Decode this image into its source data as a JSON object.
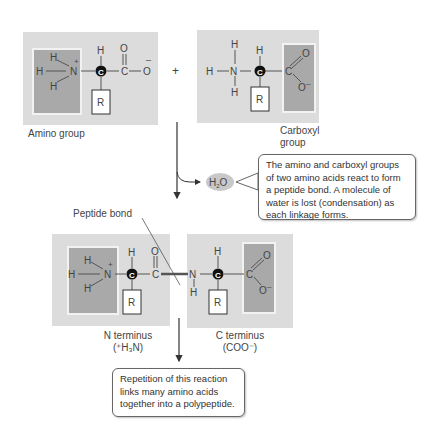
{
  "top_left_molecule": {
    "name": "amino-acid-1",
    "atoms": {
      "h_top": "H",
      "h_left": "H",
      "h_bottom": "H",
      "n": "N",
      "charge_n": "+",
      "c_alpha": "C",
      "h_alpha": "H",
      "c_carbonyl": "C",
      "o_double": "O",
      "o_single": "O",
      "charge_o": "–",
      "r": "R"
    },
    "highlight": "amino group",
    "label": "Amino group"
  },
  "plus_sign": "+",
  "top_right_molecule": {
    "name": "amino-acid-2",
    "atoms": {
      "h_top": "H",
      "h_left": "H",
      "h_bottom": "H",
      "n": "N",
      "c_alpha": "C",
      "h_alpha": "H",
      "c_carbonyl": "C",
      "o_double": "O",
      "o_single": "O",
      "charge_o": "–",
      "r": "R"
    },
    "highlight": "carboxyl group",
    "label_line1": "Carboxyl",
    "label_line2": "group"
  },
  "water": {
    "label": "H",
    "sub": "2",
    "tail": "O"
  },
  "callout_reaction": "The amino and carboxyl groups of two amino acids react to form a peptide bond. A molecule of water is lost (condensation) as each linkage forms.",
  "peptide_bond_label": "Peptide bond",
  "dipeptide": {
    "left": {
      "h_top": "H",
      "h_left": "H",
      "h_bottom": "H",
      "n": "N",
      "charge_n": "+",
      "c_alpha": "C",
      "h_alpha": "H",
      "c_carbonyl": "C",
      "o_double": "O",
      "r": "R"
    },
    "right": {
      "n": "N",
      "h_n": "H",
      "c_alpha": "C",
      "h_alpha": "H",
      "c_carbonyl": "C",
      "o_double": "O",
      "o_single": "O",
      "charge_o": "–",
      "r": "R"
    }
  },
  "n_terminus": {
    "line1": "N terminus",
    "line2": "(⁺H₃N)"
  },
  "c_terminus": {
    "line1": "C terminus",
    "line2": "(COO⁻)"
  },
  "callout_repetition": "Repetition of this reaction links many amino acids together into a polypeptide.",
  "colors": {
    "panel": "#dcdcdc",
    "highlight": "#a9a9a9",
    "water_bubble": "#c8c8c8",
    "text": "#444444"
  }
}
